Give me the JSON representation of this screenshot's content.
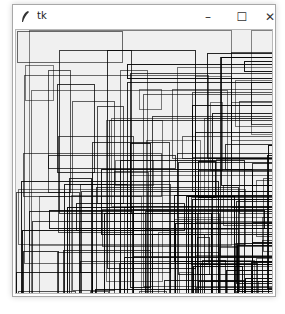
{
  "window": {
    "title": "tk",
    "controls": {
      "minimize": "–",
      "maximize": "☐",
      "close": "✕"
    }
  },
  "canvas": {
    "background": "#f0f0f0",
    "stroke": "#000000",
    "rect_count": 140,
    "seed": 7
  }
}
